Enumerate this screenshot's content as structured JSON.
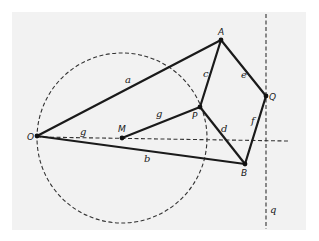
{
  "diagram": {
    "points": {
      "O": {
        "label": "O",
        "x": 37,
        "y": 136
      },
      "M": {
        "label": "M",
        "x": 122,
        "y": 138
      },
      "P": {
        "label": "P",
        "x": 200,
        "y": 107
      },
      "A": {
        "label": "A",
        "x": 221,
        "y": 40
      },
      "Q": {
        "label": "Q",
        "x": 266,
        "y": 96
      },
      "B": {
        "label": "B",
        "x": 245,
        "y": 164
      }
    },
    "segments": [
      {
        "name": "a",
        "label": "a",
        "from": "O",
        "to": "A"
      },
      {
        "name": "b",
        "label": "b",
        "from": "O",
        "to": "B"
      },
      {
        "name": "c",
        "label": "c",
        "from": "P",
        "to": "A"
      },
      {
        "name": "d",
        "label": "d",
        "from": "P",
        "to": "B"
      },
      {
        "name": "e",
        "label": "e",
        "from": "A",
        "to": "Q"
      },
      {
        "name": "f",
        "label": "f",
        "from": "Q",
        "to": "B"
      },
      {
        "name": "g-solid",
        "label": "g",
        "from": "M",
        "to": "P"
      }
    ],
    "dashed_lines": [
      {
        "name": "g",
        "label": "g",
        "description": "horizontal dashed line through O and M"
      },
      {
        "name": "q",
        "label": "q",
        "description": "vertical dashed line through Q"
      }
    ],
    "circle": {
      "center": "M",
      "through": "O",
      "style": "dashed"
    },
    "labels": {
      "a": "a",
      "b": "b",
      "c": "c",
      "d": "d",
      "e": "e",
      "f": "f",
      "g_dashed": "g",
      "g_solid": "g",
      "q": "q",
      "O": "O",
      "M": "M",
      "P": "P",
      "A": "A",
      "Q": "Q",
      "B": "B"
    }
  }
}
